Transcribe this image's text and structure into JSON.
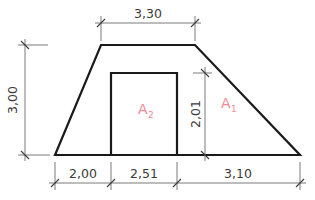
{
  "diagram": {
    "type": "trapezoid cross-section with inner rectangle",
    "dimensions": {
      "top_width": "3,30",
      "height_total": "3,00",
      "inner_height": "2,01",
      "bottom_left": "2,00",
      "bottom_middle": "2,51",
      "bottom_right": "3,10"
    },
    "areas": {
      "a1": {
        "letter": "A",
        "sub": "1"
      },
      "a2": {
        "letter": "A",
        "sub": "2"
      }
    },
    "colors": {
      "outline": "#1a1a1a",
      "dimension_line": "#7a7a7a",
      "dimension_text": "#3a3a3a",
      "area_label": "#f08a98"
    }
  }
}
